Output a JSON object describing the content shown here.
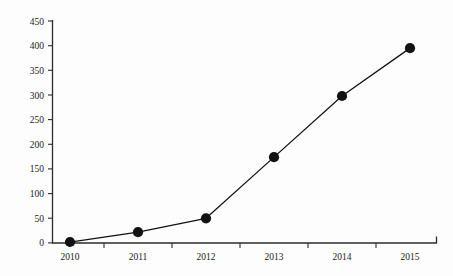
{
  "chart_data": {
    "type": "line",
    "title": "",
    "subtitle": "",
    "xlabel": "",
    "ylabel": "",
    "categories": [
      "2010",
      "2011",
      "2012",
      "2013",
      "2014",
      "2015"
    ],
    "values": [
      2,
      22,
      50,
      174,
      298,
      395
    ],
    "series": [
      {
        "name": "series-1",
        "values": [
          2,
          22,
          50,
          174,
          298,
          395
        ],
        "line_color": "#111111",
        "marker_color": "#121212",
        "marker": "filled-circle"
      }
    ],
    "ylim": [
      0,
      450
    ],
    "ytick_step": 50,
    "yticks": [
      0,
      50,
      100,
      150,
      200,
      250,
      300,
      350,
      400,
      450
    ],
    "ytick_labels": [
      "0",
      "50",
      "100",
      "150",
      "200",
      "250",
      "300",
      "350",
      "400",
      "450"
    ],
    "xtick_labels": [
      "2010",
      "2011",
      "2012",
      "2013",
      "2014",
      "2015"
    ],
    "grid": false,
    "legend": false,
    "legend_position": "none",
    "annotations": []
  },
  "style": {
    "background": "#fdfdfd",
    "axis_color": "#2b2b2b",
    "text_color": "#1a1a1a",
    "line_color": "#111111",
    "marker_color": "#121212"
  }
}
